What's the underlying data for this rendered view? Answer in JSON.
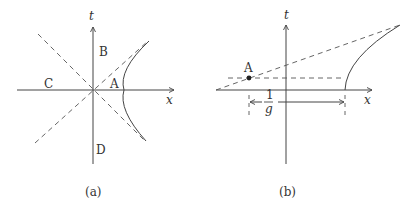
{
  "panels": [
    {
      "id": "a",
      "caption": "(a)",
      "axes": {
        "horizontal": "x",
        "vertical": "t"
      },
      "region_labels": {
        "A": "A",
        "B": "B",
        "C": "C",
        "D": "D"
      }
    },
    {
      "id": "b",
      "caption": "(b)",
      "axes": {
        "horizontal": "x",
        "vertical": "t"
      },
      "point_label": "A",
      "distance_label": {
        "numerator": "1",
        "denominator": "g"
      }
    }
  ],
  "colors": {
    "ink": "#444444",
    "background": "#ffffff"
  }
}
